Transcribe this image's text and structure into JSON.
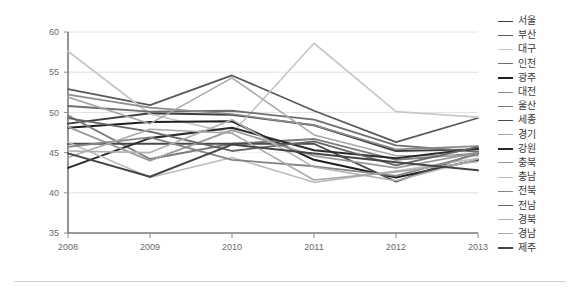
{
  "chart_data": {
    "type": "line",
    "title": "",
    "subtitle": "",
    "xlabel": "",
    "ylabel": "",
    "categories": [
      "2008",
      "2009",
      "2010",
      "2011",
      "2012",
      "2013"
    ],
    "x": [
      2008,
      2009,
      2010,
      2011,
      2012,
      2013
    ],
    "xlim": [
      2008,
      2013
    ],
    "ylim": [
      35,
      60
    ],
    "y_ticks": [
      35,
      40,
      45,
      50,
      55,
      60
    ],
    "x_ticks": [
      "2008",
      "2009",
      "2010",
      "2011",
      "2012",
      "2013"
    ],
    "grid": true,
    "legend_position": "right",
    "series": [
      {
        "name": "서울",
        "color": "#3d3d3d",
        "width": 1.9,
        "values": [
          48.6,
          49.9,
          49.7,
          48.4,
          45.2,
          45.4
        ]
      },
      {
        "name": "부산",
        "color": "#595959",
        "width": 1.7,
        "values": [
          52.9,
          50.9,
          54.6,
          50.2,
          46.3,
          49.3
        ]
      },
      {
        "name": "대구",
        "color": "#c7c7c7",
        "width": 1.7,
        "values": [
          57.6,
          49.8,
          47.4,
          58.6,
          50.1,
          49.4
        ]
      },
      {
        "name": "인천",
        "color": "#6e6e6e",
        "width": 1.9,
        "values": [
          50.8,
          50.1,
          50.2,
          49.1,
          45.9,
          45.1
        ]
      },
      {
        "name": "광주",
        "color": "#1f1f1f",
        "width": 2.1,
        "values": [
          48.1,
          48.8,
          48.9,
          44.1,
          41.9,
          44.1
        ]
      },
      {
        "name": "대전",
        "color": "#8c8c8c",
        "width": 1.7,
        "values": [
          52.2,
          50.6,
          49.8,
          48.4,
          45.4,
          45.8
        ]
      },
      {
        "name": "울산",
        "color": "#7d7d7d",
        "width": 1.9,
        "values": [
          49.6,
          44.2,
          46.1,
          46.7,
          44.1,
          44.9
        ]
      },
      {
        "name": "세종",
        "color": "#4a4a4a",
        "width": 1.9,
        "values": [
          46.1,
          46.1,
          46.1,
          46.1,
          41.4,
          45.0
        ]
      },
      {
        "name": "경기",
        "color": "#a8a8a8",
        "width": 1.6,
        "values": [
          51.9,
          48.6,
          54.3,
          47.2,
          44.6,
          44.6
        ]
      },
      {
        "name": "강원",
        "color": "#2b2b2b",
        "width": 2.1,
        "values": [
          43.1,
          46.8,
          48.1,
          45.3,
          44.3,
          45.5
        ]
      },
      {
        "name": "충북",
        "color": "#9a9a9a",
        "width": 1.7,
        "values": [
          48.2,
          44.0,
          47.8,
          44.6,
          43.1,
          45.0
        ]
      },
      {
        "name": "충남",
        "color": "#bdbdbd",
        "width": 1.6,
        "values": [
          46.3,
          41.9,
          44.4,
          41.3,
          42.7,
          44.3
        ]
      },
      {
        "name": "전북",
        "color": "#858585",
        "width": 1.8,
        "values": [
          45.7,
          46.9,
          44.1,
          43.3,
          42.1,
          44.8
        ]
      },
      {
        "name": "전남",
        "color": "#666666",
        "width": 1.8,
        "values": [
          49.3,
          47.6,
          45.2,
          46.4,
          43.4,
          45.7
        ]
      },
      {
        "name": "경북",
        "color": "#b0b0b0",
        "width": 1.6,
        "values": [
          45.2,
          45.0,
          49.1,
          43.2,
          41.5,
          44.2
        ]
      },
      {
        "name": "경남",
        "color": "#aaaaaa",
        "width": 1.6,
        "values": [
          44.4,
          47.9,
          47.4,
          41.6,
          42.6,
          43.9
        ]
      },
      {
        "name": "제주",
        "color": "#454545",
        "width": 2.0,
        "values": [
          44.9,
          42.0,
          46.0,
          44.9,
          43.8,
          42.8
        ]
      }
    ]
  },
  "legend": {
    "items": [
      {
        "label": "서울"
      },
      {
        "label": "부산"
      },
      {
        "label": "대구"
      },
      {
        "label": "인천"
      },
      {
        "label": "광주"
      },
      {
        "label": "대전"
      },
      {
        "label": "울산"
      },
      {
        "label": "세종"
      },
      {
        "label": "경기"
      },
      {
        "label": "강원"
      },
      {
        "label": "충북"
      },
      {
        "label": "충남"
      },
      {
        "label": "전북"
      },
      {
        "label": "전남"
      },
      {
        "label": "경북"
      },
      {
        "label": "경남"
      },
      {
        "label": "제주"
      }
    ]
  },
  "colors": {
    "background": "#ffffff",
    "axis": "#7a7a7a",
    "gridline": "#d8d8d8",
    "tick_text": "#6a6a6a",
    "legend_text": "#3a3a3a"
  }
}
